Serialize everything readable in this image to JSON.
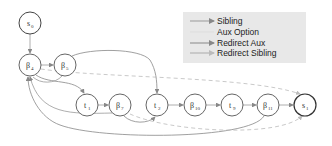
{
  "colors": {
    "node_stroke": "#666666",
    "node_stroke_terminal": "#444444",
    "node_fill": "#ffffff",
    "sibling_edge": "#999999",
    "aux_edge": "#dddddd",
    "redirect_aux_edge": "#888888",
    "redirect_sibling_edge": "#bbbbbb",
    "legend_bg": "#e8e8e8"
  },
  "legend": {
    "items": [
      {
        "label": "Sibling",
        "style": "solid"
      },
      {
        "label": "Aux Option",
        "style": "faint"
      },
      {
        "label": "Redirect Aux",
        "style": "solid-dark"
      },
      {
        "label": "Redirect Sibling",
        "style": "dashed"
      }
    ]
  },
  "nodes": [
    {
      "id": "S0",
      "base": "s",
      "sub": "0",
      "x": 30,
      "y": 23
    },
    {
      "id": "B4",
      "base": "β",
      "sub": "4",
      "x": 30,
      "y": 65
    },
    {
      "id": "B5",
      "base": "β",
      "sub": "5",
      "x": 65,
      "y": 65
    },
    {
      "id": "t1",
      "base": "t",
      "sub": "1",
      "x": 87,
      "y": 105
    },
    {
      "id": "B7",
      "base": "β",
      "sub": "7",
      "x": 120,
      "y": 105
    },
    {
      "id": "t2",
      "base": "t",
      "sub": "2",
      "x": 157,
      "y": 105
    },
    {
      "id": "B10",
      "base": "β",
      "sub": "10",
      "x": 195,
      "y": 105
    },
    {
      "id": "t9",
      "base": "t",
      "sub": "9",
      "x": 232,
      "y": 105
    },
    {
      "id": "B11",
      "base": "β",
      "sub": "11",
      "x": 268,
      "y": 105
    },
    {
      "id": "S1",
      "base": "s",
      "sub": "1",
      "x": 305,
      "y": 105
    }
  ]
}
